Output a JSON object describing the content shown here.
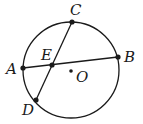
{
  "diagram": {
    "type": "geometry-circle-chords",
    "circle": {
      "center": [
        71,
        70
      ],
      "radius": 48,
      "stroke": "#1a1a1a"
    },
    "points": {
      "A": {
        "label": "A",
        "x": 23,
        "y": 68
      },
      "B": {
        "label": "B",
        "x": 118,
        "y": 57
      },
      "C": {
        "label": "C",
        "x": 72,
        "y": 22
      },
      "D": {
        "label": "D",
        "x": 36,
        "y": 100
      },
      "E": {
        "label": "E",
        "x": 52,
        "y": 65
      },
      "O": {
        "label": "O",
        "x": 71,
        "y": 71
      }
    },
    "segments": [
      "AB",
      "CD"
    ]
  }
}
